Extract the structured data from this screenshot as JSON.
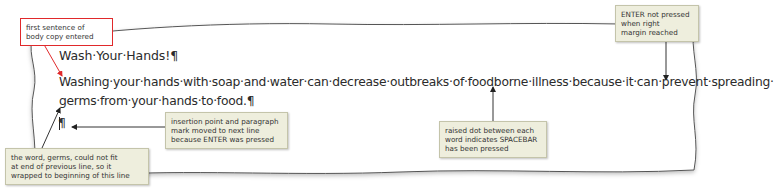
{
  "document": {
    "heading": "Wash·Your·Hands!¶",
    "body_lines": [
      "Washing·your·hands·with·soap·and·water·can·decrease·outbreaks·of·foodborne·illness·because·it·can·prevent·spreading·",
      "germs·from·your·hands·to·food.¶"
    ],
    "empty_paragraph_mark": "¶"
  },
  "callouts": {
    "first_sentence": {
      "lines": [
        "first sentence of",
        "body copy entered"
      ],
      "style": "red-outline"
    },
    "enter_not_pressed": {
      "lines": [
        "ENTER not pressed",
        "when right",
        "margin reached"
      ]
    },
    "insertion_point": {
      "lines": [
        "insertion point and paragraph",
        "mark moved to next line",
        "because ENTER was pressed"
      ]
    },
    "raised_dot": {
      "lines": [
        "raised dot between each",
        "word indicates SPACEBAR",
        "has been pressed"
      ]
    },
    "word_wrap": {
      "lines": [
        "the word, germs, could not fit",
        "at end of previous line, so it",
        "wrapped to beginning of this line"
      ]
    }
  },
  "colors": {
    "callout_fill": "#eeeedd",
    "callout_border": "#c4c4aa",
    "accent_red": "#e0292b",
    "text": "#2b2b2b",
    "paper_edge": "#555555"
  }
}
